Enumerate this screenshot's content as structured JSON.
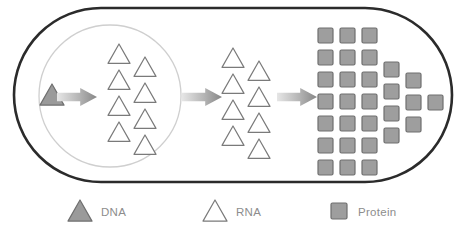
{
  "diagram": {
    "cell": {
      "name": "cell-membrane",
      "shape": "capsule",
      "x": 14,
      "y": 8,
      "width": 438,
      "height": 174,
      "stroke_color": "#2b2b2b",
      "stroke_width": 2.6,
      "fill": "#ffffff"
    },
    "nucleus": {
      "name": "nucleus",
      "shape": "circle",
      "cx": 110,
      "cy": 96,
      "r": 71,
      "stroke_color": "#cfcfcf",
      "stroke_width": 1.3,
      "fill": "none"
    },
    "colors": {
      "dna_fill": "#9a9a9a",
      "dna_stroke": "#6f6f6f",
      "rna_fill": "#ffffff",
      "rna_stroke": "#7a7a7a",
      "protein_fill": "#9e9e9e",
      "protein_stroke": "#6f6f6f",
      "arrow_light": "#e2e2e2",
      "arrow_dark": "#8a8a8a",
      "membrane": "#2b2b2b",
      "nucleus_line": "#cfcfcf",
      "legend_text": "#8d8d8d"
    },
    "dna": {
      "name": "dna-triangle",
      "count": 1,
      "size": 24,
      "items": [
        {
          "x": 40,
          "y": 84
        }
      ]
    },
    "arrows": [
      {
        "name": "arrow-replication-to-transcription",
        "x": 57,
        "y": 88,
        "width": 40,
        "height": 18
      },
      {
        "name": "arrow-nucleus-to-cytoplasm",
        "x": 182,
        "y": 88,
        "width": 40,
        "height": 18
      },
      {
        "name": "arrow-translation",
        "x": 277,
        "y": 88,
        "width": 40,
        "height": 18
      }
    ],
    "rna_nucleus": {
      "name": "rna-triangle-group-nucleus",
      "count": 8,
      "size": 22,
      "items": [
        {
          "x": 108,
          "y": 44
        },
        {
          "x": 134,
          "y": 57
        },
        {
          "x": 108,
          "y": 70
        },
        {
          "x": 134,
          "y": 83
        },
        {
          "x": 108,
          "y": 96
        },
        {
          "x": 134,
          "y": 109
        },
        {
          "x": 108,
          "y": 122
        },
        {
          "x": 134,
          "y": 135
        }
      ]
    },
    "rna_cytoplasm": {
      "name": "rna-triangle-group-cytoplasm",
      "count": 8,
      "size": 22,
      "items": [
        {
          "x": 222,
          "y": 48
        },
        {
          "x": 248,
          "y": 61
        },
        {
          "x": 222,
          "y": 74
        },
        {
          "x": 248,
          "y": 87
        },
        {
          "x": 222,
          "y": 100
        },
        {
          "x": 248,
          "y": 113
        },
        {
          "x": 222,
          "y": 126
        },
        {
          "x": 248,
          "y": 139
        }
      ]
    },
    "proteins": {
      "name": "protein-square-group",
      "count": 29,
      "size": 15,
      "items": [
        {
          "x": 318,
          "y": 28
        },
        {
          "x": 340,
          "y": 28
        },
        {
          "x": 362,
          "y": 28
        },
        {
          "x": 318,
          "y": 50
        },
        {
          "x": 340,
          "y": 50
        },
        {
          "x": 362,
          "y": 50
        },
        {
          "x": 318,
          "y": 72
        },
        {
          "x": 340,
          "y": 72
        },
        {
          "x": 362,
          "y": 72
        },
        {
          "x": 318,
          "y": 94
        },
        {
          "x": 340,
          "y": 94
        },
        {
          "x": 362,
          "y": 94
        },
        {
          "x": 318,
          "y": 116
        },
        {
          "x": 340,
          "y": 116
        },
        {
          "x": 362,
          "y": 116
        },
        {
          "x": 318,
          "y": 138
        },
        {
          "x": 340,
          "y": 138
        },
        {
          "x": 362,
          "y": 138
        },
        {
          "x": 318,
          "y": 160
        },
        {
          "x": 340,
          "y": 160
        },
        {
          "x": 362,
          "y": 160
        },
        {
          "x": 384,
          "y": 62
        },
        {
          "x": 384,
          "y": 84
        },
        {
          "x": 384,
          "y": 106
        },
        {
          "x": 384,
          "y": 128
        },
        {
          "x": 406,
          "y": 73
        },
        {
          "x": 406,
          "y": 95
        },
        {
          "x": 406,
          "y": 117
        },
        {
          "x": 428,
          "y": 95
        }
      ]
    }
  },
  "legend": {
    "name": "legend",
    "items": [
      {
        "key": "dna",
        "label": "DNA",
        "marker": "triangle-filled",
        "marker_x": 68,
        "marker_y": 200,
        "marker_size": 24,
        "label_x": 101,
        "label_y": 216
      },
      {
        "key": "rna",
        "label": "RNA",
        "marker": "triangle-outline",
        "marker_x": 203,
        "marker_y": 200,
        "marker_size": 24,
        "label_x": 236,
        "label_y": 216
      },
      {
        "key": "protein",
        "label": "Protein",
        "marker": "square-filled",
        "marker_x": 331,
        "marker_y": 203,
        "marker_size": 16,
        "label_x": 358,
        "label_y": 216
      }
    ]
  }
}
